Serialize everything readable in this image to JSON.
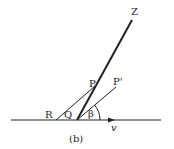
{
  "diagram": {
    "caption": "(b)",
    "labels": {
      "Z": "Z",
      "P": "P",
      "P_prime": "P'",
      "R": "R",
      "Q": "Q",
      "beta": "β",
      "v": "v"
    },
    "colors": {
      "line": "#222222",
      "background": "#ffffff"
    }
  }
}
